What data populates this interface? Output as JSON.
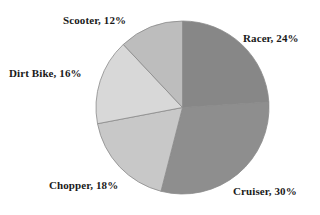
{
  "chart_data": {
    "type": "pie",
    "title": "",
    "subtitle": "",
    "xlabel": "",
    "ylabel": "",
    "grid": false,
    "legend": "none",
    "label_format": "{name}, {value}%",
    "start_angle_deg": 0,
    "direction": "clockwise",
    "geometry": {
      "center_x": 182.5,
      "center_y": 107.5,
      "radius": 86.5
    },
    "background_color": "#ffffff",
    "label_color": "#1a1a1a",
    "slice_border_color": "#8a8a8a",
    "categories": [
      "Racer",
      "Cruiser",
      "Chopper",
      "Dirt Bike",
      "Scooter"
    ],
    "values": [
      24,
      30,
      18,
      16,
      12
    ],
    "slices": [
      {
        "name": "Racer",
        "value": 24,
        "label": "Racer, 24%",
        "color": "#878787",
        "start_deg": 0,
        "end_deg": 86.4
      },
      {
        "name": "Cruiser",
        "value": 30,
        "label": "Cruiser, 30%",
        "color": "#8e8e8e",
        "start_deg": 86.4,
        "end_deg": 194.4
      },
      {
        "name": "Chopper",
        "value": 18,
        "label": "Chopper, 18%",
        "color": "#c8c8c8",
        "start_deg": 194.4,
        "end_deg": 259.2
      },
      {
        "name": "Dirt Bike",
        "value": 16,
        "label": "Dirt Bike, 16%",
        "color": "#d8d8d8",
        "start_deg": 259.2,
        "end_deg": 316.8
      },
      {
        "name": "Scooter",
        "value": 12,
        "label": "Scooter, 12%",
        "color": "#bdbdbd",
        "start_deg": 316.8,
        "end_deg": 360
      }
    ]
  },
  "labels": {
    "racer": "Racer, 24%",
    "cruiser": "Cruiser, 30%",
    "chopper": "Chopper, 18%",
    "dirt_bike": "Dirt Bike, 16%",
    "scooter": "Scooter, 12%"
  }
}
